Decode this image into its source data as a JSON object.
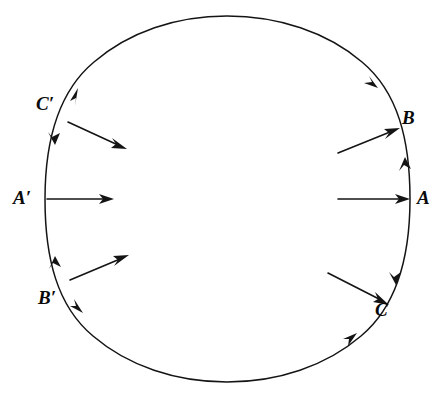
{
  "figure": {
    "background_color": "#ffffff",
    "stroke_color": "#141414",
    "circle": {
      "cx": 227,
      "cy": 199,
      "r": 183
    },
    "labels": [
      {
        "id": "C-prime",
        "text": "C′",
        "x": 36,
        "y": 94
      },
      {
        "id": "A-prime",
        "text": "A′",
        "x": 13,
        "y": 188
      },
      {
        "id": "B-prime",
        "text": "B′",
        "x": 38,
        "y": 288
      },
      {
        "id": "B",
        "text": "B",
        "x": 402,
        "y": 108
      },
      {
        "id": "A",
        "text": "A",
        "x": 417,
        "y": 188
      },
      {
        "id": "C",
        "text": "C",
        "x": 375,
        "y": 300
      }
    ],
    "radial_arrows": [
      {
        "id": "arrow-from-C-prime",
        "from": [
          68,
          122
        ],
        "to": [
          126,
          149
        ],
        "direction": "inward"
      },
      {
        "id": "arrow-from-A-prime",
        "from": [
          47,
          199
        ],
        "to": [
          113,
          199
        ],
        "direction": "inward"
      },
      {
        "id": "arrow-from-B-prime",
        "from": [
          70,
          280
        ],
        "to": [
          128,
          255
        ],
        "direction": "inward"
      },
      {
        "id": "arrow-to-B",
        "from": [
          338,
          153
        ],
        "to": [
          399,
          128
        ],
        "direction": "outward"
      },
      {
        "id": "arrow-to-A",
        "from": [
          338,
          199
        ],
        "to": [
          409,
          199
        ],
        "direction": "outward"
      },
      {
        "id": "arrow-to-C",
        "from": [
          328,
          273
        ],
        "to": [
          388,
          304
        ],
        "direction": "outward"
      }
    ],
    "circle_arrowheads": [
      {
        "id": "head-upper-left",
        "x": 78,
        "y": 88,
        "angle": -55
      },
      {
        "id": "head-left-upper",
        "x": 55,
        "y": 143,
        "angle": 104
      },
      {
        "id": "head-left-lower",
        "x": 55,
        "y": 256,
        "angle": -103
      },
      {
        "id": "head-lower-left",
        "x": 82,
        "y": 312,
        "angle": 58
      },
      {
        "id": "head-lower-right",
        "x": 356,
        "y": 334,
        "angle": -53
      },
      {
        "id": "head-upper-right",
        "x": 377,
        "y": 87,
        "angle": 57
      },
      {
        "id": "head-right-upper",
        "x": 405,
        "y": 158,
        "angle": -95
      },
      {
        "id": "head-right-lower",
        "x": 396,
        "y": 284,
        "angle": 100
      }
    ]
  }
}
